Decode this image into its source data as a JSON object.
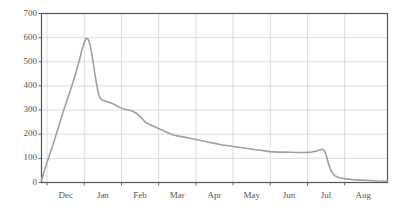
{
  "chart_data": {
    "type": "line",
    "title": "",
    "subtitle": "",
    "xlabel": "",
    "ylabel": "",
    "ylim": [
      0,
      700
    ],
    "yticks": [
      0,
      100,
      200,
      300,
      400,
      500,
      600,
      700
    ],
    "ytick_labels": [
      "0",
      "100",
      "200",
      "300",
      "400",
      "500",
      "600",
      "700"
    ],
    "xtick_labels": [
      "Dec",
      "Jan",
      "Feb",
      "Mar",
      "Apr",
      "May",
      "Jun",
      "Jul",
      "Aug"
    ],
    "x_axis_type": "month",
    "grid": true,
    "grid_color": "#d4d4d4",
    "legend": null,
    "series": [
      {
        "name": "value",
        "color": "#a0a0a0",
        "line_width": 1.6,
        "x_fraction": [
          0.0,
          0.012,
          0.025,
          0.038,
          0.05,
          0.062,
          0.075,
          0.088,
          0.1,
          0.112,
          0.118,
          0.124,
          0.13,
          0.136,
          0.142,
          0.148,
          0.154,
          0.16,
          0.166,
          0.172,
          0.18,
          0.19,
          0.2,
          0.212,
          0.225,
          0.238,
          0.25,
          0.262,
          0.275,
          0.288,
          0.3,
          0.312,
          0.325,
          0.338,
          0.35,
          0.362,
          0.375,
          0.39,
          0.405,
          0.42,
          0.44,
          0.46,
          0.48,
          0.5,
          0.52,
          0.54,
          0.56,
          0.58,
          0.6,
          0.62,
          0.64,
          0.66,
          0.68,
          0.7,
          0.72,
          0.74,
          0.76,
          0.78,
          0.795,
          0.805,
          0.812,
          0.818,
          0.824,
          0.83,
          0.838,
          0.848,
          0.86,
          0.88,
          0.9,
          0.925,
          0.95,
          0.975,
          1.0
        ],
        "values": [
          10,
          66,
          122,
          178,
          234,
          290,
          346,
          402,
          458,
          520,
          556,
          582,
          598,
          592,
          560,
          510,
          452,
          400,
          360,
          344,
          340,
          334,
          330,
          322,
          312,
          304,
          300,
          296,
          286,
          268,
          250,
          240,
          232,
          224,
          216,
          208,
          200,
          194,
          190,
          186,
          180,
          174,
          168,
          162,
          156,
          152,
          148,
          144,
          140,
          136,
          132,
          128,
          126,
          126,
          125,
          124,
          124,
          126,
          130,
          136,
          138,
          132,
          108,
          74,
          46,
          28,
          20,
          15,
          12,
          10,
          8,
          6,
          5
        ],
        "peak_value": 600,
        "peak_label": "Dec",
        "final_value": 5
      }
    ],
    "annotations": [
      {
        "text": "sharp decline",
        "near_x_label": "Jun",
        "value_before": 138,
        "value_after": 20
      }
    ]
  },
  "axes": {
    "frame_color": "#555555",
    "background": "#ffffff",
    "tick_label_color": "#555555"
  }
}
